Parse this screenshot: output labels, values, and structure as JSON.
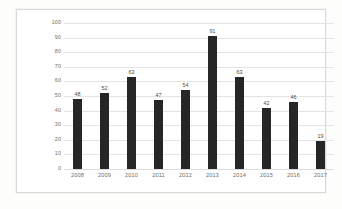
{
  "chart_data": {
    "type": "bar",
    "title": "",
    "subtitle": "",
    "xlabel": "",
    "ylabel": "",
    "categories": [
      "2008",
      "2009",
      "2010",
      "2011",
      "2012",
      "2013",
      "2014",
      "2015",
      "2016",
      "2017"
    ],
    "values": [
      48,
      52,
      63,
      47,
      54,
      91,
      63,
      42,
      46,
      19
    ],
    "data_labels": [
      "48",
      "52",
      "63",
      "47",
      "54",
      "91",
      "63",
      "42",
      "46",
      "19"
    ],
    "ylim": [
      0,
      100
    ],
    "y_ticks": [
      0,
      10,
      20,
      30,
      40,
      50,
      60,
      70,
      80,
      90,
      100
    ],
    "y_tick_labels": [
      "0",
      "10",
      "20",
      "30",
      "40",
      "50",
      "60",
      "70",
      "80",
      "90",
      "100"
    ],
    "grid": "horizontal",
    "legend": "none",
    "series": [
      {
        "name": "",
        "values": [
          48,
          52,
          63,
          47,
          54,
          91,
          63,
          42,
          46,
          19
        ]
      }
    ],
    "colors": {
      "bar": "#262626",
      "gridline": "#e4e4e4",
      "tick_label": "#6e6e6e",
      "data_label": "#4a4a4a",
      "plot_background": "#ffffff",
      "page_background": "#fdfdfc",
      "frame_border": "#d9d9d9"
    }
  }
}
